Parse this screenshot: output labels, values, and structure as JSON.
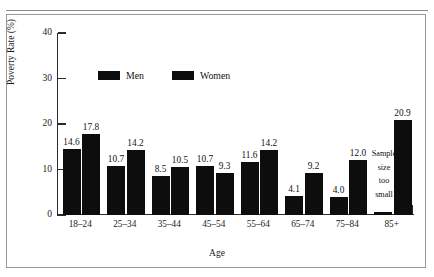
{
  "chart_data": {
    "type": "bar",
    "title": "",
    "xlabel": "Age",
    "ylabel": "Poverty Rate (%)",
    "categories": [
      "18–24",
      "25–34",
      "35–44",
      "45–54",
      "55–64",
      "65–74",
      "75–84",
      "85+"
    ],
    "series": [
      {
        "name": "Men",
        "values": [
          14.6,
          10.7,
          8.5,
          10.7,
          11.6,
          4.1,
          4.0,
          null
        ]
      },
      {
        "name": "Women",
        "values": [
          17.8,
          14.2,
          10.5,
          9.3,
          14.2,
          9.2,
          12.0,
          20.9
        ]
      }
    ],
    "value_labels": {
      "men": [
        "14.6",
        "10.7",
        "8.5",
        "10.7",
        "11.6",
        "4.1",
        "4.0",
        ""
      ],
      "women": [
        "17.8",
        "14.2",
        "10.5",
        "9.3",
        "14.2",
        "9.2",
        "12.0",
        "20.9"
      ]
    },
    "ylim": [
      0,
      40
    ],
    "yticks": [
      "0",
      "10",
      "20",
      "30",
      "40"
    ],
    "ytick_values": [
      0,
      10,
      20,
      30,
      40
    ],
    "grid": false,
    "legend_position": "top-center",
    "bar_color": "#0d0d0d",
    "annotations": [
      {
        "text": "Sample size too small",
        "lines": [
          "Sample",
          "size",
          "too",
          "small"
        ],
        "applies_to_category": "85+",
        "applies_to_series": "Men"
      }
    ]
  },
  "legend": {
    "items": [
      {
        "label": "Men"
      },
      {
        "label": "Women"
      }
    ]
  },
  "axes": {
    "y_title": "Poverty Rate (%)",
    "x_title": "Age"
  }
}
